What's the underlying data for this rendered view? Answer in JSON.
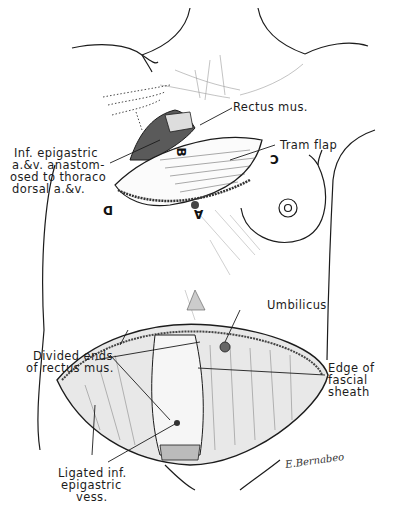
{
  "figure": {
    "type": "surgical illustration",
    "ink_color": "#1c1c1c",
    "background": "#ffffff"
  },
  "labels": {
    "rectus_mus": "Rectus mus.",
    "tram_flap": "Tram flap",
    "inf_epigastric": [
      "Inf. epigastric",
      "a.&v. anastom-",
      "osed to thoraco",
      "dorsal a.&v."
    ],
    "umbilicus": "Umbilicus",
    "divided_ends": [
      "Divided ends",
      "of rectus mus."
    ],
    "edge_fascial": [
      "Edge of",
      "fascial",
      "sheath"
    ],
    "ligated": [
      "Ligated inf.",
      "epigastric",
      "vess."
    ]
  },
  "flap_letters": {
    "a": "A",
    "b": "B",
    "c": "C",
    "d": "D"
  },
  "signature": "E.Bernabeo"
}
